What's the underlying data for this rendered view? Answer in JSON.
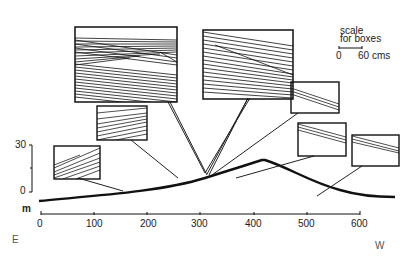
{
  "figure": {
    "type": "cross-section profile with inset boxes",
    "direction_left": "E",
    "direction_right": "W",
    "x_axis": {
      "ticks": [
        "0",
        "100",
        "200",
        "300",
        "400",
        "500",
        "600"
      ],
      "range": [
        0,
        600
      ]
    },
    "y_axis": {
      "unit": "m",
      "ticks": [
        "30",
        "0"
      ],
      "range": [
        0,
        30
      ]
    },
    "scale": {
      "title_line1": "scale",
      "title_line2": "for boxes",
      "start": "0",
      "end": "60 cms"
    },
    "boxes": [
      {
        "id": "box-1",
        "x_pos_m": 160,
        "description": "foreset laminae dipping east"
      },
      {
        "id": "box-2",
        "x_pos_m": 195,
        "description": "cross-laminated set"
      },
      {
        "id": "box-3",
        "x_pos_m": 290,
        "description": "large cross-stratified unit"
      },
      {
        "id": "box-4",
        "x_pos_m": 315,
        "description": "large cross-stratified unit"
      },
      {
        "id": "box-5",
        "x_pos_m": 330,
        "description": "laminae dipping west"
      },
      {
        "id": "box-6",
        "x_pos_m": 430,
        "description": "laminae dipping west"
      },
      {
        "id": "box-7",
        "x_pos_m": 520,
        "description": "laminae dipping west"
      }
    ]
  }
}
